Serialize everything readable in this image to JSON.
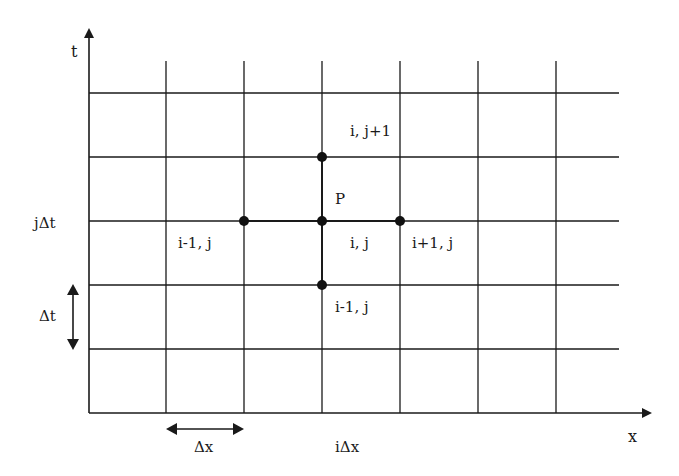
{
  "diagram": {
    "axes": {
      "x_label": "x",
      "t_label": "t"
    },
    "labels": {
      "j_dt": "jΔt",
      "dt": "Δt",
      "dx": "Δx",
      "i_dx": "iΔx",
      "point_P": "P",
      "node_top": "i, j+1",
      "node_left": "i-1, j",
      "node_center": "i, j",
      "node_right": "i+1, j",
      "node_bottom": "i-1, j"
    },
    "grid": {
      "vertical_lines": 6,
      "horizontal_lines": 5
    },
    "colors": {
      "line": "#1a1a1a",
      "background": "#ffffff"
    }
  }
}
